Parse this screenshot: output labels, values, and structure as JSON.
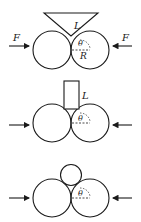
{
  "figures": [
    {
      "id": "wedge",
      "labels": {
        "force_left": "F",
        "force_right": "F",
        "length": "L",
        "angle": "θ",
        "radius": "R"
      }
    },
    {
      "id": "block",
      "labels": {
        "length": "L",
        "angle": "θ"
      }
    },
    {
      "id": "small-cylinder",
      "labels": {
        "angle": "θ"
      }
    }
  ],
  "colors": {
    "stroke": "#1a1a1a",
    "background": "#ffffff"
  }
}
